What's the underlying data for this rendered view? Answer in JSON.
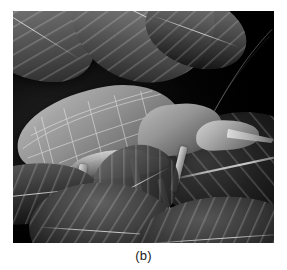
{
  "figure": {
    "caption": "(b)",
    "panel_label": "b",
    "image_type": "photograph",
    "color_mode": "grayscale",
    "background_color": "#ffffff",
    "photo_background_color": "#050505"
  },
  "photo": {
    "alt": "Grayscale close-up photograph of a leaf-mimic katydid perched among dark leaves",
    "frame": {
      "left": 13,
      "top": 11,
      "width": 261,
      "height": 232
    },
    "elements": {
      "background_leaves": [
        {
          "name": "leaf-top-left",
          "tone": "#7b7b7b"
        },
        {
          "name": "leaf-top-mid",
          "tone": "#8d8d8d"
        },
        {
          "name": "leaf-top-right",
          "tone": "#575757"
        },
        {
          "name": "leaf-bg-right",
          "tone": "#262626"
        }
      ],
      "foreground_leaves": [
        {
          "name": "leaf-fore-left",
          "tone": "#3a3a3a"
        },
        {
          "name": "leaf-fore-mid",
          "tone": "#414141"
        },
        {
          "name": "leaf-fore-right",
          "tone": "#393939"
        },
        {
          "name": "leaf-fore-mid2",
          "tone": "#434343"
        }
      ],
      "insect": {
        "label": "katydid",
        "parts": [
          "leaf-like wing",
          "pronotum",
          "head",
          "pointed snout",
          "hind leg",
          "middle leg",
          "front leg",
          "antenna"
        ],
        "wing_tone": "#a6a6a6",
        "leg_tone": "#d7d7d7"
      }
    }
  }
}
